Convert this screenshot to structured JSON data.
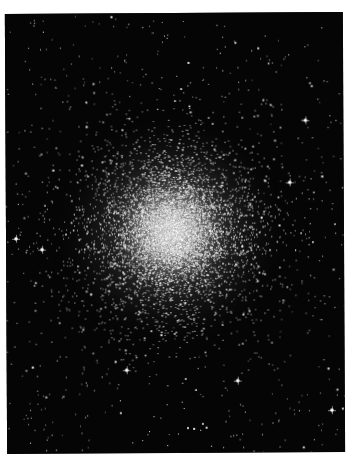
{
  "image": {
    "subject": "globular star cluster",
    "background_color": "#050505",
    "page_color": "#ffffff",
    "frame": {
      "x": 6,
      "y": 13,
      "width": 338,
      "height": 440
    },
    "cluster": {
      "center_x": 165,
      "center_y": 218,
      "core_radius": 28,
      "halo_radius": 120,
      "core_color": "#b8b8b8",
      "star_count": 9000,
      "field_star_count": 700,
      "seed": 42
    }
  }
}
